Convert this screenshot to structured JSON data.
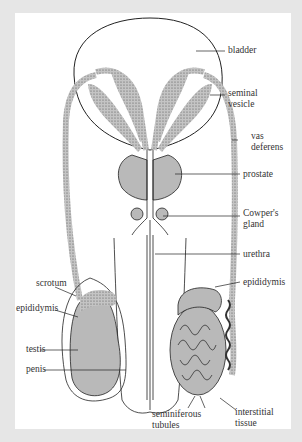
{
  "diagram": {
    "type": "anatomical illustration",
    "colors": {
      "background": "#e6e6e6",
      "panel": "#ffffff",
      "tissue_fill": "#b9b9b9",
      "outline": "#222222",
      "label": "#333333"
    },
    "labels": {
      "bladder": "bladder",
      "seminal_vesicle_1": "seminal",
      "seminal_vesicle_2": "vesicle",
      "vas_deferens_1": "vas",
      "vas_deferens_2": "deferens",
      "prostate": "prostate",
      "cowpers_gland_1": "Cowper's",
      "cowpers_gland_2": "gland",
      "urethra": "urethra",
      "epididymis_right": "epididymis",
      "scrotum": "scrotum",
      "epididymis_left": "epididymis",
      "testis": "testis",
      "penis": "penis",
      "seminiferous_tubules_1": "seminiferous",
      "seminiferous_tubules_2": "tubules",
      "interstitial_tissue_1": "interstitial",
      "interstitial_tissue_2": "tissue"
    }
  }
}
